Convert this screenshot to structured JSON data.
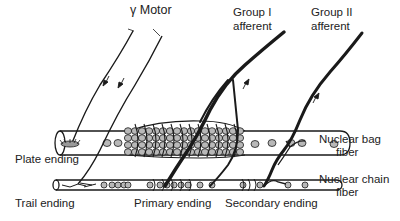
{
  "diagram": {
    "labels": {
      "gamma_motor": "γ Motor",
      "group1_line1": "Group I",
      "group1_line2": "afferent",
      "group2_line1": "Group II",
      "group2_line2": "afferent",
      "plate_ending": "Plate ending",
      "trail_ending": "Trail ending",
      "primary_ending": "Primary ending",
      "secondary_ending": "Secondary ending",
      "bag_line1": "Nuclear bag",
      "bag_line2": "fiber",
      "chain_line1": "Nuclear chain",
      "chain_line2": "fiber"
    },
    "colors": {
      "ink": "#1a1a1a",
      "nucleus_fill": "#b8b8b8",
      "background": "#ffffff"
    }
  }
}
